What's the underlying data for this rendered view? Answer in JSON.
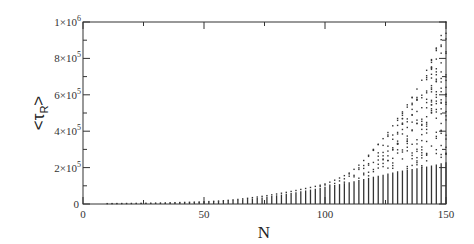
{
  "chart_data": {
    "type": "scatter",
    "title": "",
    "xlabel": "N",
    "ylabel": "<τ_R>",
    "ylabel_main": "<τ",
    "ylabel_sub": "R",
    "ylabel_close": ">",
    "xlim": [
      0,
      150
    ],
    "ylim": [
      0,
      1000000
    ],
    "grid": false,
    "legend": null,
    "x_ticks": [
      {
        "value": 0,
        "label": "0"
      },
      {
        "value": 50,
        "label": "50"
      },
      {
        "value": 100,
        "label": "100"
      },
      {
        "value": 150,
        "label": "150"
      }
    ],
    "y_ticks": [
      {
        "value": 0,
        "label": "0",
        "mant": "0",
        "exp": ""
      },
      {
        "value": 200000,
        "label": "2×10^5",
        "mant": "2×10",
        "exp": "5"
      },
      {
        "value": 400000,
        "label": "4×10^5",
        "mant": "4×10",
        "exp": "5"
      },
      {
        "value": 600000,
        "label": "6×10^5",
        "mant": "6×10",
        "exp": "5"
      },
      {
        "value": 800000,
        "label": "8×10^5",
        "mant": "8×10",
        "exp": "5"
      },
      {
        "value": 1000000,
        "label": "1×10^6",
        "mant": "1×10",
        "exp": "6"
      }
    ],
    "column_envelope": {
      "N": [
        10,
        20,
        30,
        40,
        50,
        60,
        70,
        80,
        90,
        100,
        110,
        120,
        130,
        140,
        150
      ],
      "max_value": [
        2000,
        3000,
        5000,
        8000,
        12000,
        20000,
        35000,
        55000,
        80000,
        110000,
        170000,
        300000,
        470000,
        680000,
        1000000
      ],
      "dense_top": [
        2000,
        3000,
        5000,
        8000,
        12000,
        18000,
        30000,
        48000,
        70000,
        95000,
        120000,
        150000,
        180000,
        200000,
        230000
      ]
    }
  }
}
